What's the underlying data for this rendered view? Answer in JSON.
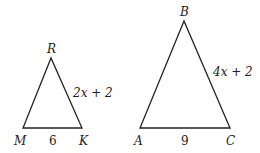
{
  "triangles": [
    {
      "name": "RMK",
      "vertices": {
        "top": "R",
        "left": "M",
        "right": "K"
      },
      "sides": {
        "base": "6",
        "right": "2x + 2"
      }
    },
    {
      "name": "BAC",
      "vertices": {
        "top": "B",
        "left": "A",
        "right": "C"
      },
      "sides": {
        "base": "9",
        "right": "4x + 2"
      }
    }
  ],
  "colors": {
    "stroke": "#222222",
    "background": "#ffffff"
  }
}
